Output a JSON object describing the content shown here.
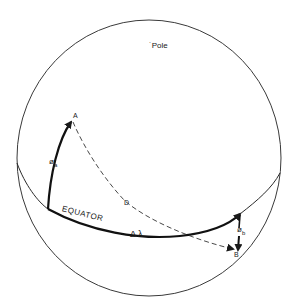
{
  "diagram": {
    "labels": {
      "pole": "˙Pole",
      "point_a": "A",
      "point_b": "B",
      "phi_a": "ø",
      "phi_a_sub": "a",
      "phi_b": "ø",
      "phi_b_sub": "b",
      "distance": "D",
      "equator": "EQUATOR",
      "delta_lambda": "Δ λ"
    },
    "colors": {
      "stroke": "#2a2a2a",
      "background": "#ffffff"
    }
  }
}
